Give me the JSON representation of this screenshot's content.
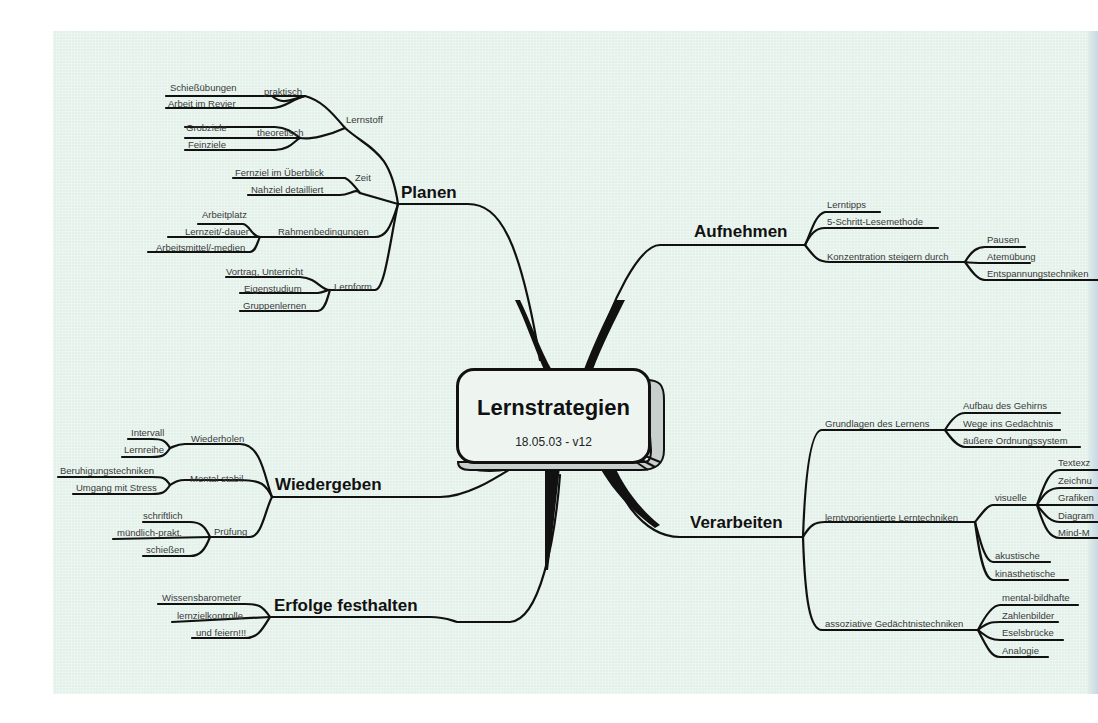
{
  "center": {
    "title": "Lernstrategien",
    "subtitle": "18.05.03 - v12"
  },
  "branches": {
    "planen": {
      "label": "Planen",
      "lernstoff": {
        "label": "Lernstoff",
        "praktisch": {
          "label": "praktisch",
          "items": [
            "Schießübungen",
            "Arbeit im Revier"
          ]
        },
        "theoretisch": {
          "label": "theoretisch",
          "items": [
            "Grobziele",
            "Feinziele"
          ]
        }
      },
      "zeit": {
        "label": "Zeit",
        "items": [
          "Fernziel im Überblick",
          "Nahziel detailliert"
        ]
      },
      "rahmen": {
        "label": "Rahmenbedingungen",
        "items": [
          "Arbeitplatz",
          "Lernzeit/-dauer",
          "Arbeitsmittel/-medien"
        ]
      },
      "lernform": {
        "label": "Lernform",
        "items": [
          "Vortrag, Unterricht",
          "Eigenstudium",
          "Gruppenlernen"
        ]
      }
    },
    "aufnehmen": {
      "label": "Aufnehmen",
      "items": [
        "Lerntipps",
        "5-Schritt-Lesemethode"
      ],
      "konzentration": {
        "label": "Konzentration steigern durch",
        "items": [
          "Pausen",
          "Atemübung",
          "Entspannungstechniken"
        ]
      }
    },
    "wiedergeben": {
      "label": "Wiedergeben",
      "wiederholen": {
        "label": "Wiederholen",
        "items": [
          "Intervall",
          "Lernreihe"
        ]
      },
      "mental": {
        "label": "Mental stabil",
        "items": [
          "Beruhigungstechniken",
          "Umgang mit Stress"
        ]
      },
      "pruefung": {
        "label": "Prüfung",
        "items": [
          "schriftlich",
          "mündlich-prakt.",
          "schießen"
        ]
      }
    },
    "erfolge": {
      "label": "Erfolge festhalten",
      "items": [
        "Wissensbarometer",
        "lernzielkontrolle",
        "und feiern!!!"
      ]
    },
    "verarbeiten": {
      "label": "Verarbeiten",
      "grundlagen": {
        "label": "Grundlagen des Lernens",
        "items": [
          "Aufbau des Gehirns",
          "Wege ins Gedächtnis",
          "äußere Ordnungssystem"
        ]
      },
      "lerntyp": {
        "label": "lerntyporientierte Lerntechniken",
        "visuelle": {
          "label": "visuelle",
          "items": [
            "Textexz",
            "Zeichnu",
            "Grafiken",
            "Diagram",
            "Mind-M"
          ]
        },
        "items": [
          "akustische",
          "kinästhetische"
        ]
      },
      "assoziativ": {
        "label": "assoziative Gedächtnistechniken",
        "items": [
          "mental-bildhafte",
          "Zahlenbilder",
          "Eselsbrücke",
          "Analogie"
        ]
      }
    }
  },
  "colors": {
    "paper": "#e3f1ea",
    "line": "#111111",
    "text": "#3a3a3a"
  }
}
